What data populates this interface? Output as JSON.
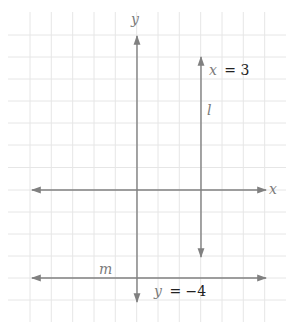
{
  "diagram": {
    "type": "coordinate-plane",
    "grid": {
      "x_start": 8,
      "x_end": 286,
      "y_start": 12,
      "y_end": 322,
      "vertical_lines": [
        30,
        51.3,
        72.7,
        94,
        115.3,
        136.7,
        158,
        179.3,
        200.7,
        222,
        243.3,
        264.7
      ],
      "horizontal_lines": [
        35,
        57,
        79,
        101,
        123,
        145,
        167.5,
        190,
        212,
        234,
        256,
        278,
        300
      ],
      "color": "#e6e6e6"
    },
    "line_color": "#808080",
    "axes": {
      "x_axis": {
        "label": "x",
        "y": 190,
        "x1": 32,
        "x2": 266
      },
      "y_axis": {
        "label": "y",
        "x": 137,
        "y1": 36,
        "y2": 302
      }
    },
    "lines": [
      {
        "name": "l",
        "equation_var": "x",
        "equation_rest": " = 3",
        "orientation": "vertical",
        "x": 201,
        "y1": 57,
        "y2": 257
      },
      {
        "name": "m",
        "equation_var": "y",
        "equation_rest": " = −4",
        "orientation": "horizontal",
        "y": 278,
        "x1": 32,
        "x2": 266
      }
    ],
    "labels": {
      "y_axis": "y",
      "x_axis": "x",
      "line_l": "l",
      "line_l_eq_var": "x",
      "line_l_eq_rest": "= 3",
      "line_m": "m",
      "line_m_eq_var": "y",
      "line_m_eq_rest": "= −4"
    }
  }
}
